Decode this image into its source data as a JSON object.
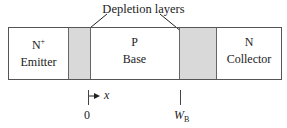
{
  "diagram": {
    "title": "Depletion layers",
    "regions": [
      {
        "doping": "N",
        "doping_sup": "+",
        "name": "Emitter"
      },
      {
        "doping": "P",
        "doping_sup": "",
        "name": "Base"
      },
      {
        "doping": "N",
        "doping_sup": "",
        "name": "Collector"
      }
    ],
    "axis": {
      "direction_label": "x",
      "origin_label": "0",
      "end_label_main": "W",
      "end_label_sub": "B"
    },
    "colors": {
      "depletion_fill": "#d9d9d9",
      "outline": "#555555"
    }
  }
}
